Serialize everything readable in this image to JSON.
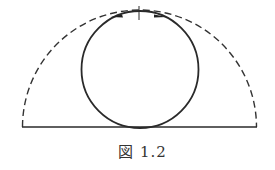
{
  "figure": {
    "caption": "図 1.2",
    "stroke_color": "#2a2a2a",
    "elements": [
      {
        "type": "dashed-semicircle",
        "cx": 139.5,
        "cy": 127,
        "r": 117
      },
      {
        "type": "circle",
        "cx": 140,
        "cy": 69.5,
        "r": 59
      },
      {
        "type": "baseline",
        "x1": 22,
        "x2": 257,
        "y": 127
      },
      {
        "type": "tick-mark",
        "x": 139,
        "y": 13
      },
      {
        "type": "arrow-left",
        "x": 118,
        "y": 15
      },
      {
        "type": "arrow-right",
        "x": 160,
        "y": 15
      }
    ]
  }
}
